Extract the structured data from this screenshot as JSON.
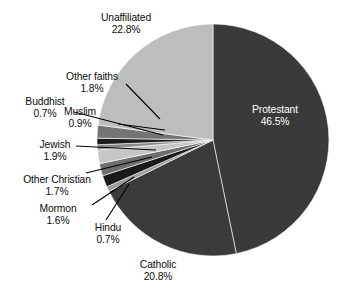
{
  "chart_data": {
    "type": "pie",
    "title": "",
    "subtitle": "",
    "xlabel": "",
    "ylabel": "",
    "legend_position": "none",
    "grid": false,
    "units": "percent",
    "start_angle_deg": 0,
    "direction": "clockwise",
    "categories": [
      "Protestant",
      "Catholic",
      "Hindu",
      "Mormon",
      "Other Christian",
      "Jewish",
      "Buddhist",
      "Muslim",
      "Other faiths",
      "Unaffiliated"
    ],
    "values": [
      46.5,
      20.8,
      0.7,
      1.6,
      1.7,
      1.9,
      0.7,
      0.9,
      1.8,
      22.8
    ],
    "slices": [
      {
        "label": "Protestant",
        "value": 46.5,
        "value_text": "46.5%",
        "color": "#3a3a3a",
        "label_placement": "inside",
        "label_color": "#ffffff"
      },
      {
        "label": "Catholic",
        "value": 20.8,
        "value_text": "20.8%",
        "color": "#3b3b3b",
        "label_placement": "outside",
        "label_color": "#0d0d0d"
      },
      {
        "label": "Hindu",
        "value": 0.7,
        "value_text": "0.7%",
        "color": "#9b9b9b",
        "label_placement": "outside-leader",
        "label_color": "#0d0d0d"
      },
      {
        "label": "Mormon",
        "value": 1.6,
        "value_text": "1.6%",
        "color": "#1a1a1a",
        "label_placement": "outside-leader",
        "label_color": "#0d0d0d"
      },
      {
        "label": "Other Christian",
        "value": 1.7,
        "value_text": "1.7%",
        "color": "#6e6e6e",
        "label_placement": "outside-leader",
        "label_color": "#0d0d0d"
      },
      {
        "label": "Jewish",
        "value": 1.9,
        "value_text": "1.9%",
        "color": "#c6c6c6",
        "label_placement": "outside-leader",
        "label_color": "#0d0d0d"
      },
      {
        "label": "Buddhist",
        "value": 0.7,
        "value_text": "0.7%",
        "color": "#8a8a8a",
        "label_placement": "outside-leader",
        "label_color": "#0d0d0d"
      },
      {
        "label": "Muslim",
        "value": 0.9,
        "value_text": "0.9%",
        "color": "#1c1c1c",
        "label_placement": "outside-leader",
        "label_color": "#0d0d0d"
      },
      {
        "label": "Other faiths",
        "value": 1.8,
        "value_text": "1.8%",
        "color": "#747474",
        "label_placement": "outside-leader",
        "label_color": "#0d0d0d"
      },
      {
        "label": "Unaffiliated",
        "value": 22.8,
        "value_text": "22.8%",
        "color": "#bdbdbd",
        "label_placement": "outside",
        "label_color": "#0d0d0d"
      }
    ]
  },
  "labels": {
    "unaffiliated": {
      "name": "Unaffiliated",
      "value": "22.8%"
    },
    "other_faiths": {
      "name": "Other faiths",
      "value": "1.8%"
    },
    "buddhist": {
      "name": "Buddhist",
      "value": "0.7%"
    },
    "muslim": {
      "name": "Muslim",
      "value": "0.9%"
    },
    "jewish": {
      "name": "Jewish",
      "value": "1.9%"
    },
    "other_christian": {
      "name": "Other Christian",
      "value": "1.7%"
    },
    "mormon": {
      "name": "Mormon",
      "value": "1.6%"
    },
    "hindu": {
      "name": "Hindu",
      "value": "0.7%"
    },
    "catholic": {
      "name": "Catholic",
      "value": "20.8%"
    },
    "protestant": {
      "name": "Protestant",
      "value": "46.5%"
    }
  },
  "geometry": {
    "center_x": 213,
    "center_y": 140,
    "radius": 116
  },
  "colors": {
    "background": "#ffffff",
    "text": "#0d0d0d",
    "inside_text": "#ffffff",
    "leader": "#000000"
  }
}
